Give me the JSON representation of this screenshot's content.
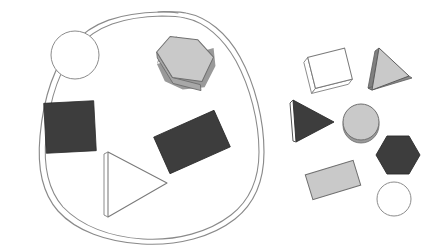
{
  "scene": {
    "title": "Shape grouping diagram",
    "width": 433,
    "height": 247,
    "background_color": "#ffffff",
    "description": "A hand-drawn closed loop encircles five shapes on the left; seven loose shapes sit outside the loop on the right."
  },
  "palette": {
    "dark_fill": "#3d3d3d",
    "dark_stroke": "#2b2b2b",
    "light_gray_fill": "#c9c9c9",
    "light_gray_shadow": "#9a9a9a",
    "white_fill": "#ffffff",
    "outline_stroke": "#7a7a7a",
    "thin_stroke": "#8c8c8c",
    "loop_stroke": "#8a8a8a"
  },
  "loop": {
    "name": "hand-drawn enclosure",
    "stroke_color": "#8a8a8a",
    "stroke_width": 1.1,
    "doubled": true,
    "outer_path": "M 58 174 C 53 140 55 104 66 74 C 76 46 96 26 124 19 C 152 12 183 13 206 13 C 226 13 243 21 249 24 C 259 29 251 26 262 32 C 274 39 231 20 242 26 C 249 30 248 29 254 33",
    "path": "M 54 178 C 48 142 51 101 64 70 C 76 41 99 22 129 16 C 158 10 186 11 207 11 C 224 11 238 16 248 23 C 252 26 253 27 256 29",
    "full_path": "M 55 177 C 49 141 52 100 65 69 C 78 40 101 21 131 15 C 160 9 187 10 208 10 C 226 10 240 16 250 24 C 257 30 252 26 258 31 C 262 34 260 33 263 35",
    "combined_path": "M 56 176 C 50 140 53 99 66 68 C 79 39 102 20 132 14 C 161 8 188 9 209 9 C 227 9 241 15 251 23 C 258 29 253 25 259 30"
  },
  "left_group": {
    "name": "shapes inside the loop",
    "count": 5,
    "shapes": [
      {
        "id": "inner-circle-white",
        "type": "circle",
        "label": "white circle",
        "fill": "#ffffff",
        "stroke": "#8c8c8c",
        "cx": 75,
        "cy": 55,
        "r": 24
      },
      {
        "id": "inner-hexagon-gray",
        "type": "hexagon",
        "label": "light gray hexagon",
        "fill": "#c9c9c9",
        "stroke": "#6f6f6f",
        "shadow": "#9a9a9a",
        "cx": 186,
        "cy": 63,
        "r": 29,
        "rotation": -8,
        "extruded": true
      },
      {
        "id": "inner-square-dark",
        "type": "square",
        "label": "dark square",
        "fill": "#3d3d3d",
        "stroke": "#2b2b2b",
        "cx": 70,
        "cy": 127,
        "size": 48,
        "rotation": -3
      },
      {
        "id": "inner-rectangle-dark",
        "type": "rectangle",
        "label": "dark rectangle",
        "fill": "#3d3d3d",
        "stroke": "#2b2b2b",
        "cx": 192,
        "cy": 142,
        "width": 62,
        "height": 38,
        "rotation": -24
      },
      {
        "id": "inner-triangle-white",
        "type": "triangle",
        "label": "white triangle",
        "fill": "#ffffff",
        "stroke": "#7a7a7a",
        "points": "106,153 106,216 166,182",
        "extruded": true
      }
    ]
  },
  "right_group": {
    "name": "shapes outside the loop",
    "count": 7,
    "shapes": [
      {
        "id": "outer-square-white",
        "type": "square",
        "label": "white square",
        "fill": "#ffffff",
        "stroke": "#7a7a7a",
        "cx": 329,
        "cy": 67,
        "size": 31,
        "rotation": -14,
        "extruded": true
      },
      {
        "id": "outer-triangle-gray",
        "type": "triangle",
        "label": "light gray triangle",
        "fill": "#c9c9c9",
        "stroke": "#5c5c5c",
        "points": "378,50 410,75 371,89",
        "extruded": true
      },
      {
        "id": "outer-triangle-dark",
        "type": "triangle",
        "label": "dark triangle",
        "fill": "#3d3d3d",
        "stroke": "#2b2b2b",
        "points": "294,102 330,122 299,140"
      },
      {
        "id": "outer-circle-gray",
        "type": "circle",
        "label": "light gray circle",
        "fill": "#c9c9c9",
        "stroke": "#6f6f6f",
        "shadow": "#9a9a9a",
        "cx": 361,
        "cy": 122,
        "r": 18,
        "extruded": true
      },
      {
        "id": "outer-hexagon-dark",
        "type": "hexagon",
        "label": "dark hexagon",
        "fill": "#3d3d3d",
        "stroke": "#2b2b2b",
        "cx": 398,
        "cy": 155,
        "r": 20,
        "rotation": 0
      },
      {
        "id": "outer-rectangle-gray",
        "type": "rectangle",
        "label": "light gray rectangle",
        "fill": "#c9c9c9",
        "stroke": "#6f6f6f",
        "cx": 333,
        "cy": 180,
        "width": 45,
        "height": 23,
        "rotation": -16
      },
      {
        "id": "outer-circle-white",
        "type": "circle",
        "label": "white circle",
        "fill": "#ffffff",
        "stroke": "#8c8c8c",
        "cx": 394,
        "cy": 199,
        "r": 17
      }
    ]
  }
}
